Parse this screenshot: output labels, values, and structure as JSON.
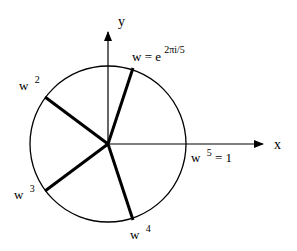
{
  "diagram": {
    "axes": {
      "x_label": "x",
      "y_label": "y"
    },
    "labels": {
      "w_base": "w = e",
      "w_exponent": "2πi/5",
      "w2_base": "w",
      "w2_exp": "2",
      "w3_base": "w",
      "w3_exp": "3",
      "w4_base": "w",
      "w4_exp": "4",
      "w5_base": "w",
      "w5_exp": "5",
      "w5_eq": "= 1"
    },
    "colors": {
      "stroke": "#000000",
      "background": "#ffffff"
    }
  }
}
